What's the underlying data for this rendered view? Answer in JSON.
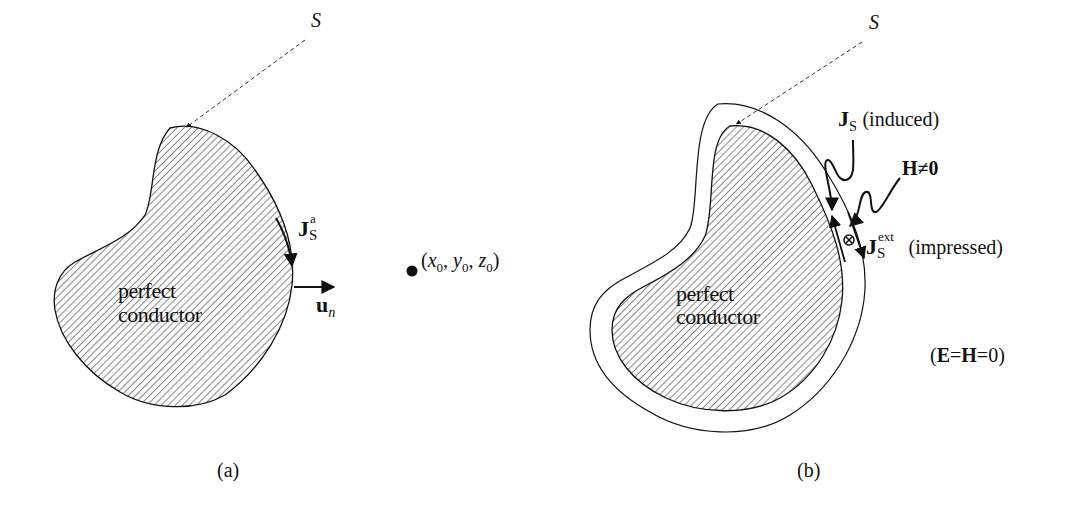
{
  "panel_a": {
    "surface_label": "S",
    "body_label_line1": "perfect",
    "body_label_line2": "conductor",
    "current_symbol": "J",
    "current_sub": "S",
    "current_sup": "a",
    "normal_symbol": "u",
    "normal_sub": "n",
    "point_label": "(x0, y0, z0)",
    "point_parts": {
      "open": "(",
      "x": "x",
      "y": "y",
      "z": "z",
      "sub": "0",
      "sep": ", ",
      "close": ")"
    },
    "caption": "(a)"
  },
  "panel_b": {
    "surface_label": "S",
    "body_label_line1": "perfect",
    "body_label_line2": "conductor",
    "induced_symbol": "J",
    "induced_sub": "S",
    "induced_text": "(induced)",
    "field_label": "H≠0",
    "impressed_symbol": "J",
    "impressed_sub": "S",
    "impressed_sup": "ext",
    "impressed_text": "(impressed)",
    "outside_condition": "(E=H=0)",
    "outside_parts": {
      "open": "(",
      "E": "E",
      "eq1": "=",
      "H": "H",
      "eq2": "=0)"
    },
    "caption": "(b)"
  },
  "colors": {
    "ink": "#111111",
    "background": "#ffffff"
  }
}
